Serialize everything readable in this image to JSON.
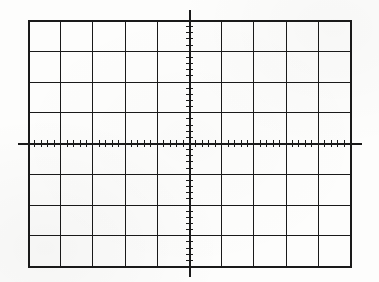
{
  "figure": {
    "description": "Blank CRT oscilloscope screen graticule with 10 horizontal divisions by 8 vertical divisions and centre axes marked with minor ticks",
    "background_color": "#fdfdfc",
    "line_color": "#1a1a1a"
  },
  "chart_data": {
    "type": "scatter",
    "title": "",
    "subtitle": "",
    "xlabel": "",
    "ylabel": "",
    "categories": [],
    "values": [],
    "series": [],
    "annotations": [],
    "grid": {
      "enabled": true,
      "horizontal_divisions": 10,
      "vertical_divisions": 8,
      "minor_ticks_per_division": 5,
      "major_line_color": "#1a1a1a",
      "major_line_width_px": 1.6,
      "border_line_width_px": 2.0
    },
    "axes": {
      "x_axis": {
        "label": "",
        "position": "center",
        "range": [
          -5,
          5
        ],
        "tick_interval": 0.2,
        "major_tick_interval": 1,
        "tick_labels": [],
        "overhang_px": 10,
        "line_width_px": 2.0
      },
      "y_axis": {
        "label": "",
        "position": "center",
        "range": [
          -4,
          4
        ],
        "tick_interval": 0.2,
        "major_tick_interval": 1,
        "tick_labels": [],
        "overhang_px": 10,
        "line_width_px": 2.0
      }
    },
    "legend": {
      "entries": [],
      "position": "none"
    },
    "xlim": [
      -5,
      5
    ],
    "ylim": [
      -4,
      4
    ]
  },
  "geometry": {
    "plot_left_px": 28,
    "plot_top_px": 20,
    "plot_right_px": 350,
    "plot_bottom_px": 266,
    "center_x_px": 189,
    "center_y_px": 143,
    "x_axis_start_px": 18,
    "x_axis_end_px": 362,
    "y_axis_start_px": 10,
    "y_axis_end_px": 277,
    "minor_tick_half_length_px": 3.2
  }
}
